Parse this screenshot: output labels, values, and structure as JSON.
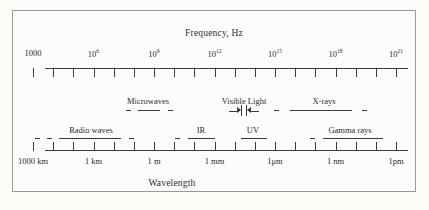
{
  "figure": {
    "title_frequency": "Frequency, Hz",
    "title_wavelength": "Wavelength"
  },
  "chart_data": {
    "type": "diagram",
    "xlabel_top": "Frequency, Hz",
    "xlabel_bottom": "Wavelength",
    "grid": false,
    "legend": "none",
    "frequency_axis": {
      "label": "Frequency, Hz",
      "unit": "Hz",
      "tick_count": 19,
      "labeled_ticks": [
        {
          "index": 0,
          "text": "1000",
          "mantissa": "1000",
          "exponent": "",
          "value": 1000
        },
        {
          "index": 3,
          "text": "10^6",
          "mantissa": "10",
          "exponent": "6",
          "value": 1000000.0
        },
        {
          "index": 6,
          "text": "10^9",
          "mantissa": "10",
          "exponent": "9",
          "value": 1000000000.0
        },
        {
          "index": 9,
          "text": "10^12",
          "mantissa": "10",
          "exponent": "12",
          "value": 1000000000000.0
        },
        {
          "index": 12,
          "text": "10^15",
          "mantissa": "10",
          "exponent": "15",
          "value": 1000000000000000.0
        },
        {
          "index": 15,
          "text": "10^18",
          "mantissa": "10",
          "exponent": "18",
          "value": 1e+18
        },
        {
          "index": 18,
          "text": "10^21",
          "mantissa": "10",
          "exponent": "21",
          "value": 1e+21
        }
      ]
    },
    "wavelength_axis": {
      "label": "Wavelength",
      "tick_count": 19,
      "labeled_ticks": [
        {
          "index": 0,
          "text": "1000 km",
          "value_m": 1000000.0
        },
        {
          "index": 3,
          "text": "1 km",
          "value_m": 1000.0
        },
        {
          "index": 6,
          "text": "1 m",
          "value_m": 1
        },
        {
          "index": 9,
          "text": "1 mm",
          "value_m": 0.001
        },
        {
          "index": 12,
          "text": "1μm",
          "value_m": 1e-06
        },
        {
          "index": 15,
          "text": "1 nm",
          "value_m": 1e-09
        },
        {
          "index": 18,
          "text": "1pm",
          "value_m": 1e-12
        }
      ]
    },
    "bands": [
      {
        "name": "Radio waves",
        "row": "lower",
        "label": "Radio waves"
      },
      {
        "name": "Microwaves",
        "row": "upper",
        "label": "Microwaves"
      },
      {
        "name": "IR",
        "row": "lower",
        "label": "IR"
      },
      {
        "name": "Visible Light",
        "row": "upper",
        "label": "Visible Light"
      },
      {
        "name": "UV",
        "row": "lower",
        "label": "UV"
      },
      {
        "name": "X-rays",
        "row": "upper",
        "label": "X-rays"
      },
      {
        "name": "Gamma rays",
        "row": "lower",
        "label": "Gamma rays"
      }
    ]
  },
  "labels": {
    "radio_waves": "Radio waves",
    "microwaves": "Microwaves",
    "infrared": "IR",
    "visible_light": "Visible Light",
    "ultraviolet": "UV",
    "xrays": "X-rays",
    "gamma_rays": "Gamma rays"
  },
  "colors": {
    "ink": "#3a3a38",
    "border": "#9a9a96",
    "paper": "#fbfbf8"
  }
}
